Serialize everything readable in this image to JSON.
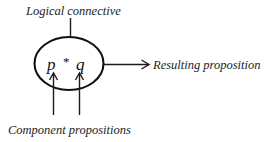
{
  "diagram": {
    "background_color": "#ffffff",
    "line_color": "#1a1a1a",
    "text_color": "#1c1c1c",
    "labels": {
      "top": "Logical connective",
      "right": "Resulting proposition",
      "bottom": "Component propositions"
    },
    "node": {
      "shape": "ellipse",
      "formula": {
        "left_operand": "p",
        "operator": "*",
        "right_operand": "q",
        "full": "p * q"
      }
    },
    "arrows": [
      {
        "name": "connective-arrow",
        "direction": "down",
        "from": "Logical connective",
        "to": "p * q"
      },
      {
        "name": "operand-arrow-left",
        "direction": "up",
        "from": "Component propositions",
        "to": "p"
      },
      {
        "name": "operand-arrow-right",
        "direction": "up",
        "from": "Component propositions",
        "to": "q"
      },
      {
        "name": "result-arrow",
        "direction": "right",
        "from": "p * q",
        "to": "Resulting proposition"
      }
    ]
  }
}
